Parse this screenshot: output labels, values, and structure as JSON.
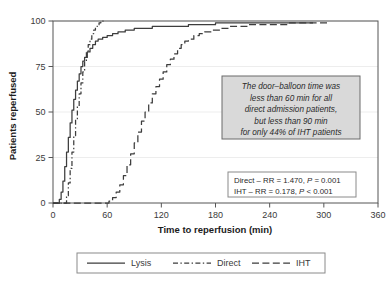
{
  "chart_data": {
    "type": "line",
    "title": "",
    "xlabel": "Time to reperfusion (min)",
    "ylabel": "Patients reperfused",
    "xlim": [
      0,
      360
    ],
    "ylim": [
      0,
      100
    ],
    "xticks": [
      0,
      60,
      120,
      180,
      240,
      300,
      360
    ],
    "xtick_labels": [
      "0",
      "60",
      "120",
      "180",
      "240",
      "300",
      "360"
    ],
    "yticks": [
      0,
      25,
      50,
      75,
      100
    ],
    "ytick_labels": [
      "0",
      "25",
      "50",
      "75",
      "100"
    ],
    "grid": "horizontal-light",
    "legend_position": "below-plot",
    "series": [
      {
        "name": "Lysis",
        "style": "solid",
        "color": "#3d3d3d",
        "points": [
          [
            0,
            0
          ],
          [
            5,
            0
          ],
          [
            7,
            2
          ],
          [
            9,
            6
          ],
          [
            11,
            12
          ],
          [
            13,
            20
          ],
          [
            15,
            28
          ],
          [
            17,
            36
          ],
          [
            19,
            44
          ],
          [
            21,
            51
          ],
          [
            23,
            57
          ],
          [
            25,
            62
          ],
          [
            27,
            67
          ],
          [
            29,
            71
          ],
          [
            31,
            75
          ],
          [
            33,
            78
          ],
          [
            35,
            80
          ],
          [
            38,
            83
          ],
          [
            41,
            85
          ],
          [
            44,
            87
          ],
          [
            47,
            89
          ],
          [
            50,
            90
          ],
          [
            55,
            91
          ],
          [
            60,
            92
          ],
          [
            66,
            93
          ],
          [
            72,
            94
          ],
          [
            80,
            95
          ],
          [
            90,
            96
          ],
          [
            100,
            96
          ],
          [
            110,
            97
          ],
          [
            120,
            97
          ],
          [
            130,
            97
          ],
          [
            142,
            97
          ],
          [
            150,
            98
          ],
          [
            165,
            98
          ],
          [
            180,
            99
          ],
          [
            195,
            99
          ],
          [
            210,
            99
          ],
          [
            225,
            99
          ],
          [
            240,
            99
          ],
          [
            255,
            99
          ],
          [
            265,
            99
          ],
          [
            275,
            99
          ],
          [
            288,
            99
          ]
        ]
      },
      {
        "name": "Direct",
        "style": "dashdot",
        "color": "#3d3d3d",
        "points": [
          [
            0,
            0
          ],
          [
            13,
            0
          ],
          [
            15,
            4
          ],
          [
            17,
            11
          ],
          [
            19,
            19
          ],
          [
            21,
            28
          ],
          [
            23,
            37
          ],
          [
            25,
            46
          ],
          [
            27,
            53
          ],
          [
            29,
            60
          ],
          [
            31,
            66
          ],
          [
            33,
            72
          ],
          [
            35,
            78
          ],
          [
            37,
            83
          ],
          [
            39,
            87
          ],
          [
            41,
            90
          ],
          [
            43,
            93
          ],
          [
            45,
            95
          ],
          [
            47,
            97
          ],
          [
            49,
            98
          ],
          [
            51,
            99
          ],
          [
            53,
            100
          ],
          [
            56,
            100
          ]
        ]
      },
      {
        "name": "IHT",
        "style": "longdash",
        "color": "#3d3d3d",
        "points": [
          [
            0,
            0
          ],
          [
            58,
            0
          ],
          [
            62,
            1
          ],
          [
            66,
            3
          ],
          [
            70,
            6
          ],
          [
            74,
            10
          ],
          [
            78,
            15
          ],
          [
            82,
            21
          ],
          [
            86,
            27
          ],
          [
            90,
            33
          ],
          [
            94,
            39
          ],
          [
            98,
            45
          ],
          [
            102,
            50
          ],
          [
            106,
            55
          ],
          [
            110,
            60
          ],
          [
            114,
            64
          ],
          [
            118,
            68
          ],
          [
            122,
            72
          ],
          [
            126,
            76
          ],
          [
            130,
            79
          ],
          [
            134,
            82
          ],
          [
            138,
            85
          ],
          [
            142,
            87
          ],
          [
            146,
            89
          ],
          [
            150,
            90
          ],
          [
            156,
            92
          ],
          [
            162,
            93
          ],
          [
            168,
            94
          ],
          [
            176,
            95
          ],
          [
            186,
            96
          ],
          [
            196,
            97
          ],
          [
            206,
            97
          ],
          [
            216,
            98
          ],
          [
            228,
            98
          ],
          [
            240,
            98
          ],
          [
            252,
            98
          ],
          [
            262,
            99
          ],
          [
            272,
            99
          ],
          [
            282,
            99
          ],
          [
            295,
            99
          ],
          [
            305,
            99
          ]
        ]
      }
    ],
    "annotation": {
      "lines": [
        "The door–balloon time was",
        "less than 60 min for all",
        "direct admission patients,",
        "but less than 90 min",
        "for only 44% of IHT patients"
      ]
    },
    "stats_box": {
      "rows": [
        {
          "prefix": "Direct – RR = 1.470, ",
          "ital": "P",
          "suffix": " = 0.001"
        },
        {
          "prefix": "IHT – RR = 0.178, ",
          "ital": "P",
          "suffix": " < 0.001"
        }
      ]
    },
    "legend_entries": [
      {
        "label": "Lysis",
        "style": "solid"
      },
      {
        "label": "Direct",
        "style": "dashdot"
      },
      {
        "label": "IHT",
        "style": "longdash"
      }
    ]
  },
  "colors": {
    "line": "#3d3d3d",
    "axis": "#555555",
    "grid": "#e8e8e8",
    "annotation_fill": "#d9d9d9",
    "annotation_stroke": "#6a6a6a",
    "box_stroke": "#8a8a8a",
    "background": "#ffffff"
  }
}
